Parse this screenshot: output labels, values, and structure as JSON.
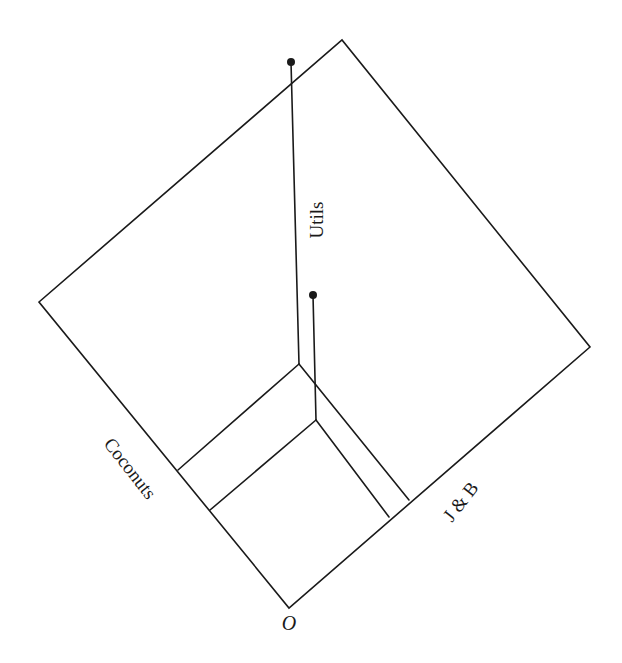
{
  "diagram": {
    "title": "",
    "labels": {
      "utils": "Utils",
      "coconuts": "Coconuts",
      "jb": "J & B",
      "origin": "O"
    },
    "geometry": {
      "plane": {
        "left": [
          39,
          302
        ],
        "top": [
          342,
          40
        ],
        "right": [
          590,
          347
        ],
        "origin": [
          289,
          608
        ]
      },
      "bundles": [
        {
          "name": "larger-bundle",
          "coconut_tick": [
            178,
            470
          ],
          "jb_tick": [
            409,
            500
          ],
          "corner": [
            299,
            364
          ],
          "utils_top": [
            291,
            62
          ]
        },
        {
          "name": "smaller-bundle",
          "coconut_tick": [
            210,
            510
          ],
          "jb_tick": [
            389,
            517
          ],
          "corner": [
            316,
            420
          ],
          "utils_top": [
            313,
            295
          ]
        }
      ]
    }
  }
}
